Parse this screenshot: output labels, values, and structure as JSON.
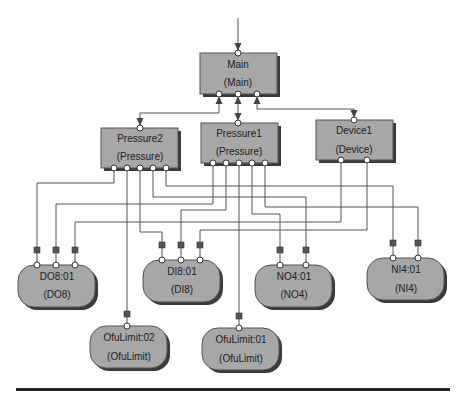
{
  "diagram": {
    "colors": {
      "node_fill": "#a7a7a7",
      "node_shadow": "#3a3a3a",
      "wire": "#555555",
      "port_fill": "#ffffff",
      "divider": "#222222"
    },
    "blocks": [
      {
        "id": "main",
        "name": "Main",
        "type": "(Main)",
        "shape": "rect"
      },
      {
        "id": "pressure2",
        "name": "Pressure2",
        "type": "(Pressure)",
        "shape": "rect"
      },
      {
        "id": "pressure1",
        "name": "Pressure1",
        "type": "(Pressure)",
        "shape": "rect"
      },
      {
        "id": "device1",
        "name": "Device1",
        "type": "(Device)",
        "shape": "rect"
      }
    ],
    "devices": [
      {
        "id": "do8",
        "name": "DO8:01",
        "type": "(DO8)",
        "shape": "rounded"
      },
      {
        "id": "di8",
        "name": "DI8:01",
        "type": "(DI8)",
        "shape": "rounded"
      },
      {
        "id": "no4",
        "name": "NO4:01",
        "type": "(NO4)",
        "shape": "rounded"
      },
      {
        "id": "ni4",
        "name": "NI4:01",
        "type": "(NI4)",
        "shape": "rounded"
      },
      {
        "id": "ofulimit02",
        "name": "OfuLimit:02",
        "type": "(OfuLimit)",
        "shape": "rounded"
      },
      {
        "id": "ofulimit01",
        "name": "OfuLimit:01",
        "type": "(OfuLimit)",
        "shape": "rounded"
      }
    ],
    "connections": [
      {
        "from": "input",
        "to": "Main"
      },
      {
        "from": "Main",
        "to": "Pressure2"
      },
      {
        "from": "Main",
        "to": "Pressure1"
      },
      {
        "from": "Main",
        "to": "Device1"
      },
      {
        "from": "Pressure2",
        "to": "DO8:01"
      },
      {
        "from": "Pressure2",
        "to": "OfuLimit:02"
      },
      {
        "from": "Pressure2",
        "to": "DI8:01"
      },
      {
        "from": "Pressure2",
        "to": "NO4:01"
      },
      {
        "from": "Pressure2",
        "to": "NI4:01"
      },
      {
        "from": "Pressure1",
        "to": "DO8:01"
      },
      {
        "from": "Pressure1",
        "to": "DI8:01"
      },
      {
        "from": "Pressure1",
        "to": "OfuLimit:01"
      },
      {
        "from": "Pressure1",
        "to": "NO4:01"
      },
      {
        "from": "Pressure1",
        "to": "NI4:01"
      },
      {
        "from": "Device1",
        "to": "DO8:01"
      },
      {
        "from": "Device1",
        "to": "DI8:01"
      }
    ]
  }
}
